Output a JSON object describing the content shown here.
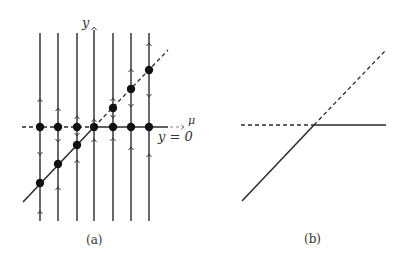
{
  "figure": {
    "panels": [
      {
        "id": "a",
        "caption": "(a)",
        "axis_labels": {
          "y": "y",
          "x": "μ",
          "line_label": "y = 0"
        },
        "vertical_flow_lines_x": [
          40,
          58,
          77,
          94,
          113,
          131,
          149
        ],
        "fixed_points_on_axis_y0": 7,
        "fixed_points_on_diagonal": 6,
        "branches": [
          {
            "name": "y=0 left",
            "style": "dashed",
            "stability": "unstable"
          },
          {
            "name": "y=0 right",
            "style": "solid",
            "stability": "stable"
          },
          {
            "name": "y=mu left",
            "style": "solid",
            "stability": "stable"
          },
          {
            "name": "y=mu right",
            "style": "dashed",
            "stability": "unstable"
          }
        ]
      },
      {
        "id": "b",
        "caption": "(b)",
        "description": "Transcritical bifurcation diagram: solid = stable, dashed = unstable"
      }
    ]
  },
  "colors": {
    "line": "#2a2a2a",
    "dot": "#111111",
    "label": "#333333"
  }
}
